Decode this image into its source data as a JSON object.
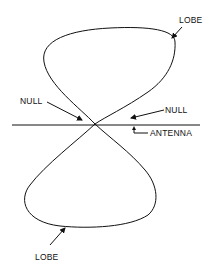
{
  "diagram": {
    "type": "antenna-radiation-pattern",
    "colors": {
      "stroke": "#111111",
      "background": "#ffffff"
    },
    "labels": {
      "lobe_top": "LOBE",
      "null_left": "NULL",
      "null_right": "NULL",
      "antenna": "ANTENNA",
      "lobe_bottom": "LOBE"
    }
  }
}
